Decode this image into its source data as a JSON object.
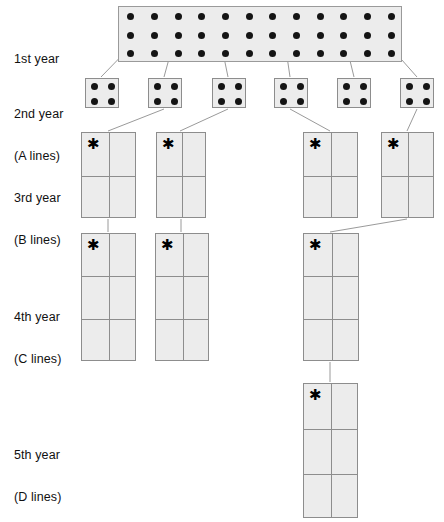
{
  "figure": {
    "background_color": "#ffffff",
    "plot_fill_color": "#ececec",
    "plot_border_color": "#8d8d8d",
    "dot_color": "#141414",
    "connector_color": "#9a9a9a",
    "star_symbol": "✱"
  },
  "rows": [
    {
      "id": "year-1",
      "label": "1st year",
      "label_line1": "1st year",
      "label_line2": "",
      "plot_kind": "dot-nursery",
      "plot_count": 1,
      "dot_columns": 12,
      "dot_rows": 3,
      "dot_total": 36,
      "starred": false
    },
    {
      "id": "year-2",
      "label": "2nd year (A lines)",
      "label_line1": "2nd year",
      "label_line2": "(A lines)",
      "plot_kind": "dot-plot",
      "plot_count": 6,
      "dot_columns": 2,
      "dot_rows": 2,
      "dot_total": 4,
      "starred": false
    },
    {
      "id": "year-3",
      "label": "3rd year (B lines)",
      "label_line1": "3rd year",
      "label_line2": "(B lines)",
      "plot_kind": "grid-plot",
      "plot_count": 4,
      "grid_columns": 2,
      "grid_rows": 2,
      "starred": true
    },
    {
      "id": "year-4",
      "label": "4th year (C lines)",
      "label_line1": "4th year",
      "label_line2": "(C lines)",
      "plot_kind": "grid-plot",
      "plot_count": 3,
      "grid_columns": 2,
      "grid_rows": 3,
      "starred": true
    },
    {
      "id": "year-5",
      "label": "5th year (D lines)",
      "label_line1": "5th year",
      "label_line2": "(D lines)",
      "plot_kind": "grid-plot",
      "plot_count": 1,
      "grid_columns": 2,
      "grid_rows": 3,
      "starred": true
    }
  ],
  "year1_nursery": {
    "x": 118,
    "y": 6,
    "width": 284,
    "height": 56,
    "columns": 12,
    "rows": 3
  },
  "year2_plots": [
    {
      "index": 1,
      "x": 85,
      "y": 78,
      "width": 34,
      "height": 30
    },
    {
      "index": 2,
      "x": 148,
      "y": 78,
      "width": 34,
      "height": 30
    },
    {
      "index": 3,
      "x": 212,
      "y": 78,
      "width": 34,
      "height": 30
    },
    {
      "index": 4,
      "x": 274,
      "y": 78,
      "width": 34,
      "height": 30
    },
    {
      "index": 5,
      "x": 337,
      "y": 78,
      "width": 34,
      "height": 30
    },
    {
      "index": 6,
      "x": 400,
      "y": 78,
      "width": 34,
      "height": 30
    }
  ],
  "year3_plots": [
    {
      "index": 1,
      "x": 81,
      "y": 132,
      "width": 55,
      "height": 86
    },
    {
      "index": 2,
      "x": 156,
      "y": 132,
      "width": 50,
      "height": 86
    },
    {
      "index": 3,
      "x": 303,
      "y": 132,
      "width": 55,
      "height": 86
    },
    {
      "index": 4,
      "x": 381,
      "y": 132,
      "width": 53,
      "height": 86
    }
  ],
  "year4_plots": [
    {
      "index": 1,
      "x": 81,
      "y": 233,
      "width": 55,
      "height": 128
    },
    {
      "index": 2,
      "x": 155,
      "y": 233,
      "width": 54,
      "height": 128
    },
    {
      "index": 3,
      "x": 303,
      "y": 233,
      "width": 56,
      "height": 128
    }
  ],
  "year5_plots": [
    {
      "index": 1,
      "x": 303,
      "y": 383,
      "width": 55,
      "height": 135
    }
  ],
  "connectors": [
    {
      "from": "year1",
      "to": "year2-1",
      "x1": 135,
      "y1": 42,
      "x2": 101,
      "y2": 77
    },
    {
      "from": "year1",
      "to": "year2-2",
      "x1": 178,
      "y1": 26,
      "x2": 164,
      "y2": 77
    },
    {
      "from": "year1",
      "to": "year2-3",
      "x1": 220,
      "y1": 38,
      "x2": 228,
      "y2": 77
    },
    {
      "from": "year1",
      "to": "year2-4",
      "x1": 282,
      "y1": 22,
      "x2": 290,
      "y2": 77
    },
    {
      "from": "year1",
      "to": "year2-5",
      "x1": 344,
      "y1": 36,
      "x2": 354,
      "y2": 77
    },
    {
      "from": "year1",
      "to": "year2-6",
      "x1": 386,
      "y1": 42,
      "x2": 417,
      "y2": 77
    },
    {
      "from": "year2-2",
      "to": "year3-1",
      "x1": 164,
      "y1": 109,
      "x2": 108,
      "y2": 131
    },
    {
      "from": "year2-3",
      "to": "year3-2",
      "x1": 228,
      "y1": 109,
      "x2": 180,
      "y2": 131
    },
    {
      "from": "year2-4",
      "to": "year3-3",
      "x1": 290,
      "y1": 109,
      "x2": 330,
      "y2": 131
    },
    {
      "from": "year2-6",
      "to": "year3-4",
      "x1": 417,
      "y1": 109,
      "x2": 407,
      "y2": 131
    },
    {
      "from": "year3-1",
      "to": "year4-1",
      "x1": 108,
      "y1": 219,
      "x2": 108,
      "y2": 232
    },
    {
      "from": "year3-2",
      "to": "year4-2",
      "x1": 181,
      "y1": 219,
      "x2": 181,
      "y2": 232
    },
    {
      "from": "year3-4",
      "to": "year4-3",
      "x1": 407,
      "y1": 219,
      "x2": 330,
      "y2": 232
    },
    {
      "from": "year4-3",
      "to": "year5-1",
      "x1": 330,
      "y1": 362,
      "x2": 330,
      "y2": 382
    }
  ],
  "labels": {
    "year1_line1": "1st year",
    "year2_line1": "2nd year",
    "year2_line2": "(A lines)",
    "year3_line1": "3rd year",
    "year3_line2": "(B lines)",
    "year4_line1": "4th year",
    "year4_line2": "(C lines)",
    "year5_line1": "5th year",
    "year5_line2": "(D lines)"
  }
}
